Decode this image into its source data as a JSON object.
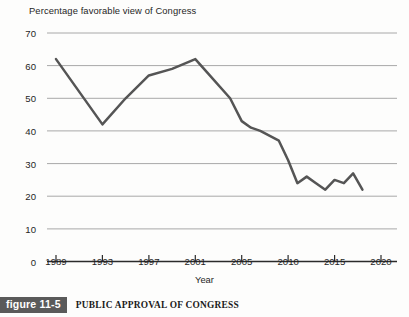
{
  "chart_data": {
    "type": "line",
    "title": "Percentage favorable view of Congress",
    "xlabel": "Year",
    "ylabel": "",
    "xlim": [
      1989,
      2020
    ],
    "ylim": [
      0,
      70
    ],
    "grid": true,
    "legend": null,
    "x_ticks": [
      "1989",
      "1993",
      "1997",
      "2001",
      "2005",
      "2010",
      "2015",
      "2020"
    ],
    "x_tick_values": [
      1989,
      1993,
      1997,
      2001,
      2005,
      2010,
      2015,
      2020
    ],
    "y_ticks": [
      "0",
      "10",
      "20",
      "30",
      "40",
      "50",
      "60",
      "70"
    ],
    "y_tick_values": [
      0,
      10,
      20,
      30,
      40,
      50,
      60,
      70
    ],
    "series": [
      {
        "name": "Percentage favorable view of Congress",
        "color": "#555555",
        "x": [
          1989,
          1993,
          1995,
          1997,
          1999,
          2001,
          2002,
          2004,
          2005,
          2006,
          2007,
          2009,
          2010,
          2011,
          2012,
          2013,
          2014,
          2015,
          2016,
          2017,
          2018
        ],
        "values": [
          62,
          42,
          50,
          57,
          59,
          62,
          58,
          50,
          43,
          41,
          40,
          37,
          31,
          24,
          26,
          24,
          22,
          25,
          24,
          27,
          22
        ]
      }
    ]
  },
  "caption": {
    "badge": "figure 11-5",
    "text": "PUBLIC APPROVAL OF CONGRESS"
  },
  "colors": {
    "line": "#555555",
    "grid": "#a8a8a8",
    "axis": "#2b2b2b",
    "badge_bg": "#5a5a5a",
    "badge_fg": "#ffffff"
  }
}
